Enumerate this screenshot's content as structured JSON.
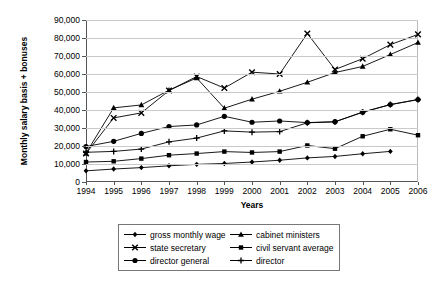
{
  "chart_data": {
    "type": "line",
    "title": "",
    "xlabel": "Years",
    "ylabel": "Monthly salary basis + bonuses",
    "x": [
      1994,
      1995,
      1996,
      1997,
      1998,
      1999,
      2000,
      2001,
      2002,
      2003,
      2004,
      2005,
      2006
    ],
    "xtick_labels": [
      "1994",
      "1995",
      "1996",
      "1997",
      "1998",
      "1999",
      "2000",
      "2001",
      "2002",
      "2003",
      "2004",
      "2005",
      "2006"
    ],
    "ytick_labels": [
      "0",
      "10,000",
      "20,000",
      "30,000",
      "40,000",
      "50,000",
      "60,000",
      "70,000",
      "80,000",
      "90,000"
    ],
    "yticks": [
      0,
      10000,
      20000,
      30000,
      40000,
      50000,
      60000,
      70000,
      80000,
      90000
    ],
    "ylim": [
      0,
      90000
    ],
    "xlim": [
      1994,
      2006
    ],
    "grid": "horizontal",
    "legend_position": "bottom",
    "series": [
      {
        "name": "gross monthly wage",
        "marker": "diamond",
        "values": [
          6200,
          7200,
          8000,
          9000,
          9800,
          10300,
          11100,
          12100,
          13400,
          14200,
          15700,
          17000,
          null
        ]
      },
      {
        "name": "cabinet ministers",
        "marker": "triangle",
        "values": [
          16000,
          41200,
          42800,
          51000,
          57800,
          41000,
          46000,
          50400,
          55400,
          60800,
          64200,
          70800,
          77500
        ]
      },
      {
        "name": "state secretary",
        "marker": "cross",
        "values": [
          15800,
          35600,
          38400,
          50800,
          58600,
          52200,
          61000,
          60000,
          82500,
          62500,
          68500,
          76300,
          82000
        ]
      },
      {
        "name": "civil servant average",
        "marker": "square",
        "values": [
          11100,
          11500,
          13000,
          14900,
          15800,
          16900,
          16400,
          16900,
          20300,
          18500,
          25400,
          29300,
          26000
        ]
      },
      {
        "name": "director general",
        "marker": "circle",
        "values": [
          19700,
          22600,
          27000,
          30800,
          31700,
          36500,
          33200,
          33900,
          33000,
          33500,
          38800,
          43000,
          45800
        ]
      },
      {
        "name": "director",
        "marker": "plus",
        "values": [
          16500,
          17000,
          18300,
          22300,
          24400,
          28400,
          27700,
          28000,
          32900,
          33400,
          38800,
          43000,
          45800
        ]
      }
    ]
  },
  "legend": {
    "items": [
      {
        "label": "gross monthly wage",
        "marker": "diamond"
      },
      {
        "label": "cabinet ministers",
        "marker": "triangle"
      },
      {
        "label": "state secretary",
        "marker": "cross"
      },
      {
        "label": "civil servant average",
        "marker": "square"
      },
      {
        "label": "director general",
        "marker": "circle"
      },
      {
        "label": "director",
        "marker": "plus"
      }
    ]
  },
  "colors": {
    "line": "#000000",
    "grid": "#c9c9c9",
    "axis": "#555555",
    "background": "#ffffff"
  }
}
